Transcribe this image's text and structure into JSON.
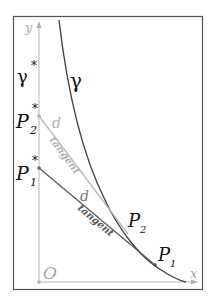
{
  "diagram": {
    "colors": {
      "frame": "#555555",
      "axis": "#b0b0b0",
      "curve": "#444444",
      "tangent_light": "#b8b8b8",
      "tangent_dark": "#5a5a5a",
      "text_dark": "#111111",
      "text_light": "#a8a8a8"
    },
    "axes": {
      "x_label": "x",
      "y_label": "y",
      "origin_label": "O"
    },
    "curves": {
      "gamma_label": "γ",
      "gamma_star_label": "γ",
      "gamma_star_sup": "*"
    },
    "points": {
      "P1": {
        "base": "P",
        "sub": "1"
      },
      "P2": {
        "base": "P",
        "sub": "2"
      },
      "P1_star": {
        "base": "P",
        "sub": "1",
        "sup": "*"
      },
      "P2_star": {
        "base": "P",
        "sub": "2",
        "sup": "*"
      }
    },
    "segments": {
      "upper": {
        "distance_label": "d",
        "tangent_label": "tangent"
      },
      "lower": {
        "distance_label": "d",
        "tangent_label": "tangent"
      }
    }
  }
}
